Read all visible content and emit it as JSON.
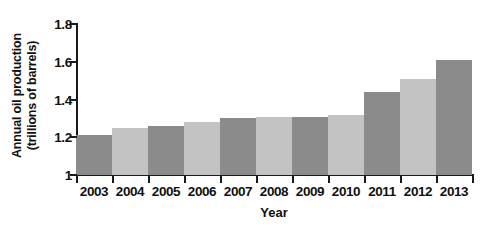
{
  "chart_data": {
    "type": "bar",
    "title": "",
    "xlabel": "Year",
    "ylabel": "Annual oil production\n(trillions of barrels)",
    "ylabel_lines": [
      "Annual oil production",
      "(trillions of barrels)"
    ],
    "categories": [
      "2003",
      "2004",
      "2005",
      "2006",
      "2007",
      "2008",
      "2009",
      "2010",
      "2011",
      "2012",
      "2013"
    ],
    "values": [
      1.21,
      1.25,
      1.26,
      1.28,
      1.3,
      1.31,
      1.31,
      1.32,
      1.44,
      1.51,
      1.61
    ],
    "yticks": [
      "1",
      "1.2",
      "1.4",
      "1.6",
      "1.8"
    ],
    "ytick_values": [
      1,
      1.2,
      1.4,
      1.6,
      1.8
    ],
    "ylim": [
      1,
      1.8
    ],
    "grid": false,
    "legend": false,
    "bar_colors": [
      "#8b8b8b",
      "#c3c3c3",
      "#8b8b8b",
      "#c3c3c3",
      "#8b8b8b",
      "#c3c3c3",
      "#8b8b8b",
      "#c3c3c3",
      "#8b8b8b",
      "#c3c3c3",
      "#8b8b8b"
    ],
    "axis_color": "#1a1a1a",
    "background": "#ffffff"
  }
}
